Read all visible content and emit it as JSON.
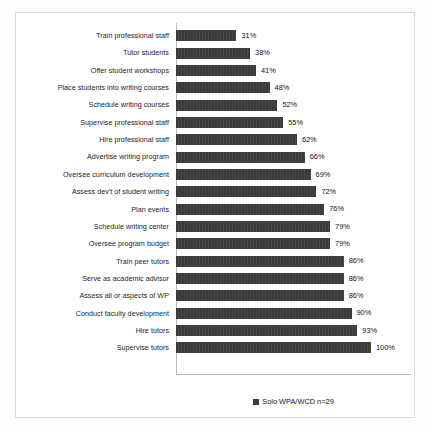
{
  "chart_data": {
    "type": "bar",
    "orientation": "horizontal",
    "title": "",
    "subtitle": "",
    "xlabel": "",
    "ylabel": "",
    "xlim": [
      0,
      100
    ],
    "grid": false,
    "legend_position": "bottom",
    "value_suffix": "%",
    "categories": [
      "Train professional staff",
      "Tutor students",
      "Offer student workshops",
      "Place students into writing courses",
      "Schedule writing courses",
      "Supervise professional staff",
      "Hire professional staff",
      "Advertise writing program",
      "Oversee curriculum development",
      "Assess dev't of student writing",
      "Plan events",
      "Schedule writing center",
      "Oversee program budget",
      "Train peer tutors",
      "Serve as academic advisor",
      "Assess all or aspects of WP",
      "Conduct faculty development",
      "Hire tutors",
      "Supervise tutors"
    ],
    "values": [
      31,
      38,
      41,
      48,
      52,
      55,
      62,
      66,
      69,
      72,
      76,
      79,
      79,
      86,
      86,
      86,
      90,
      93,
      100
    ],
    "value_labels": [
      "31%",
      "38%",
      "41%",
      "48%",
      "52%",
      "55%",
      "62%",
      "66%",
      "69%",
      "72%",
      "76%",
      "79%",
      "79%",
      "86%",
      "86%",
      "86%",
      "90%",
      "93%",
      "100%"
    ],
    "series": [
      {
        "name": "Solo WPA/WCD n=29",
        "color": "#3a3a3a",
        "values": [
          31,
          38,
          41,
          48,
          52,
          55,
          62,
          66,
          69,
          72,
          76,
          79,
          79,
          86,
          86,
          86,
          90,
          93,
          100
        ]
      }
    ]
  },
  "legend": {
    "entries": [
      {
        "label": "Solo WPA/WCD n=29",
        "color": "#3a3a3a",
        "marker": "square-marker"
      }
    ]
  },
  "colors": {
    "bar": "#3a3a3a",
    "axis": "#bdbdbd",
    "frame": "#d9d9d9",
    "text": "#1d1d1d",
    "background": "#ffffff"
  }
}
